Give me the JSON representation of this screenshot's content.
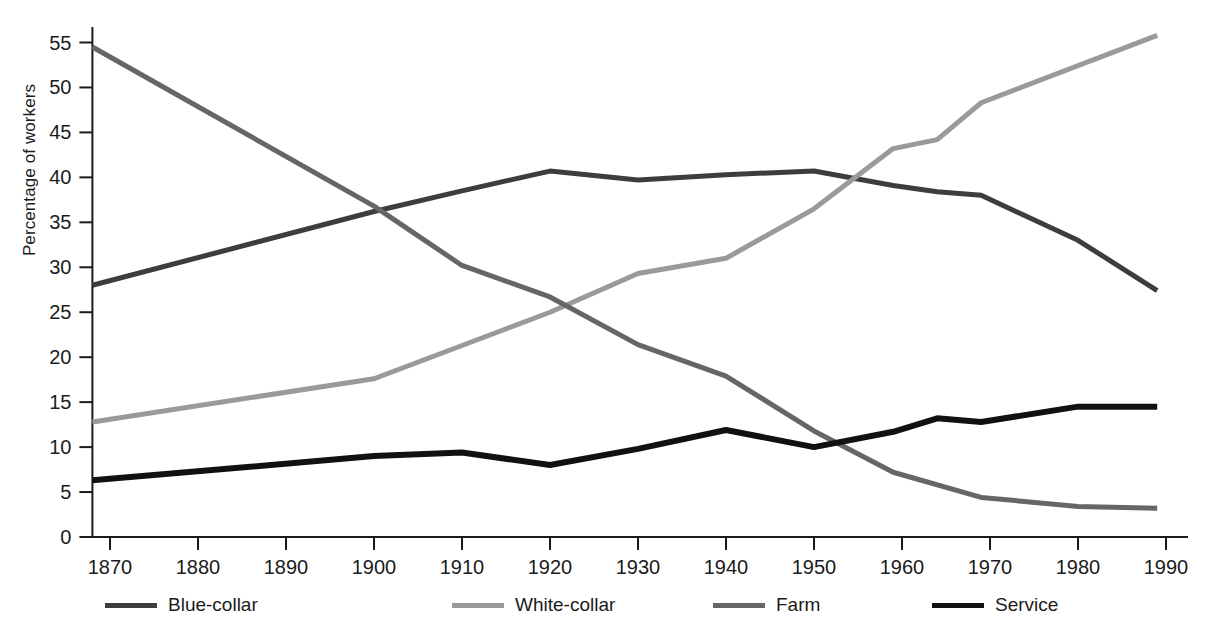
{
  "chart_data": {
    "type": "line",
    "title": "",
    "xlabel": "",
    "ylabel": "Percentage of workers",
    "xlim": [
      1868,
      1990
    ],
    "ylim": [
      0,
      56.5
    ],
    "grid": false,
    "legend_position": "bottom",
    "xticks": [
      1870,
      1880,
      1890,
      1900,
      1910,
      1920,
      1930,
      1940,
      1950,
      1960,
      1970,
      1980,
      1990
    ],
    "xtick_labels": [
      "1870",
      "1880",
      "1890",
      "1900",
      "1910",
      "1920",
      "1930",
      "1940",
      "1950",
      "1960",
      "1970",
      "1980",
      "1990"
    ],
    "yticks": [
      0,
      5,
      10,
      15,
      20,
      25,
      30,
      35,
      40,
      45,
      50,
      55
    ],
    "ytick_labels": [
      "0",
      "5",
      "10",
      "15",
      "20",
      "25",
      "30",
      "35",
      "40",
      "45",
      "50",
      "55"
    ],
    "series": [
      {
        "name": "Blue-collar",
        "color": "#3d3d3d",
        "width": 5,
        "x": [
          1868,
          1900,
          1910,
          1920,
          1930,
          1940,
          1950,
          1959,
          1964,
          1969,
          1980,
          1989
        ],
        "values": [
          28.0,
          36.2,
          38.5,
          40.7,
          39.7,
          40.3,
          40.7,
          39.1,
          38.4,
          38.0,
          33.0,
          27.4
        ]
      },
      {
        "name": "White-collar",
        "color": "#9a9a9a",
        "width": 5,
        "x": [
          1868,
          1900,
          1910,
          1920,
          1930,
          1940,
          1950,
          1959,
          1964,
          1969,
          1989
        ],
        "values": [
          12.8,
          17.6,
          21.3,
          25.0,
          29.3,
          31.0,
          36.5,
          43.2,
          44.2,
          48.3,
          55.8
        ]
      },
      {
        "name": "Farm",
        "color": "#666666",
        "width": 5,
        "x": [
          1868,
          1900,
          1910,
          1920,
          1930,
          1940,
          1950,
          1959,
          1969,
          1980,
          1989
        ],
        "values": [
          54.5,
          36.8,
          30.2,
          26.7,
          21.4,
          17.9,
          11.8,
          7.2,
          4.4,
          3.4,
          3.2
        ]
      },
      {
        "name": "Service",
        "color": "#111111",
        "width": 6,
        "x": [
          1868,
          1900,
          1910,
          1920,
          1930,
          1940,
          1950,
          1959,
          1964,
          1969,
          1980,
          1989
        ],
        "values": [
          6.3,
          9.0,
          9.4,
          8.0,
          9.8,
          11.9,
          10.0,
          11.7,
          13.2,
          12.8,
          14.5,
          14.5
        ]
      }
    ]
  },
  "legend": {
    "items": [
      {
        "label": "Blue-collar",
        "color": "#3d3d3d"
      },
      {
        "label": "White-collar",
        "color": "#9a9a9a"
      },
      {
        "label": "Farm",
        "color": "#666666"
      },
      {
        "label": "Service",
        "color": "#111111"
      }
    ]
  },
  "axis": {
    "y_title": "Percentage of workers"
  }
}
